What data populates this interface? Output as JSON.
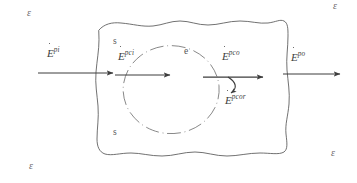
{
  "figure": {
    "background_color": "#ffffff",
    "ink_color": "#4a4a4a",
    "canvas": {
      "width": 357,
      "height": 183
    }
  },
  "regions": {
    "outer_boundary_name": "hand-drawn control volume blob",
    "inner_boundary_name": "dashed circle sub-region",
    "labels": [
      {
        "id": "s-top",
        "text": "s",
        "x": 113,
        "y": 42
      },
      {
        "id": "s-bottom",
        "text": "s",
        "x": 113,
        "y": 133
      },
      {
        "id": "e-inner",
        "text": "e",
        "x": 184,
        "y": 52
      }
    ]
  },
  "environment_labels": [
    {
      "id": "eps-top-left",
      "text": "ε",
      "x": 27,
      "y": 14
    },
    {
      "id": "eps-top-right",
      "text": "ε",
      "x": 333,
      "y": 6
    },
    {
      "id": "eps-bottom-left",
      "text": "ε",
      "x": 29,
      "y": 167
    },
    {
      "id": "eps-bottom-right",
      "text": "ε",
      "x": 331,
      "y": 154
    }
  ],
  "flows": [
    {
      "id": "e-pi",
      "base": "E",
      "superscript": "pi",
      "has_overdot": true,
      "description": "energy rate in from environment",
      "label_x": 47,
      "label_y": 54,
      "arrow": {
        "x1": 38,
        "y1": 73,
        "x2": 113,
        "y2": 73
      }
    },
    {
      "id": "e-pci",
      "base": "E",
      "superscript": "pci",
      "has_overdot": true,
      "description": "energy rate into the inner sub-region",
      "label_x": 118,
      "label_y": 57,
      "arrow": {
        "x1": 115,
        "y1": 75,
        "x2": 170,
        "y2": 75
      }
    },
    {
      "id": "e-pco",
      "base": "E",
      "superscript": "pco",
      "has_overdot": true,
      "description": "energy rate out of the inner sub-region",
      "label_x": 222,
      "label_y": 57,
      "arrow": {
        "x1": 203,
        "y1": 77,
        "x2": 263,
        "y2": 77
      }
    },
    {
      "id": "e-pcor",
      "base": "E",
      "superscript": "pcor",
      "has_overdot": true,
      "description": "recirculated / returned energy rate (curved branch)",
      "label_x": 225,
      "label_y": 100,
      "arrow": {
        "curved": true
      }
    },
    {
      "id": "e-po",
      "base": "E",
      "superscript": "po",
      "has_overdot": true,
      "description": "energy rate out to environment",
      "label_x": 291,
      "label_y": 58,
      "arrow": {
        "x1": 283,
        "y1": 74,
        "x2": 340,
        "y2": 74
      }
    }
  ]
}
